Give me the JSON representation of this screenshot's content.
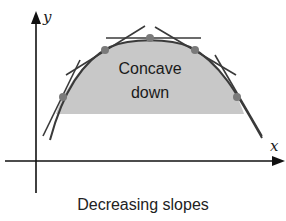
{
  "figure": {
    "axis_labels": {
      "x": "x",
      "y": "y"
    },
    "region_label": {
      "line1": "Concave",
      "line2": "down"
    },
    "caption": "Decreasing slopes",
    "colors": {
      "fill": "#c8c8c8",
      "curve": "#3a3a3a",
      "tangent": "#3a3a3a",
      "point": "#7a7a7a",
      "axis": "#111111"
    },
    "points": [
      {
        "x": 63,
        "y": 97
      },
      {
        "x": 105,
        "y": 50
      },
      {
        "x": 150,
        "y": 38
      },
      {
        "x": 195,
        "y": 50
      },
      {
        "x": 237,
        "y": 97
      }
    ]
  }
}
